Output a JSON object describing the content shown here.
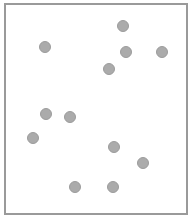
{
  "diagram": {
    "frame": {
      "border_color": "#9a9a9a",
      "background": "#ffffff"
    },
    "dot_style": {
      "fill": "#ababab",
      "stroke": "#9c9c9c",
      "diameter": 12
    },
    "dots": [
      {
        "x": 123,
        "y": 26
      },
      {
        "x": 45,
        "y": 47
      },
      {
        "x": 126,
        "y": 52
      },
      {
        "x": 162,
        "y": 52
      },
      {
        "x": 109,
        "y": 69
      },
      {
        "x": 46,
        "y": 114
      },
      {
        "x": 70,
        "y": 117
      },
      {
        "x": 33,
        "y": 138
      },
      {
        "x": 114,
        "y": 147
      },
      {
        "x": 143,
        "y": 163
      },
      {
        "x": 75,
        "y": 187
      },
      {
        "x": 113,
        "y": 187
      }
    ]
  }
}
